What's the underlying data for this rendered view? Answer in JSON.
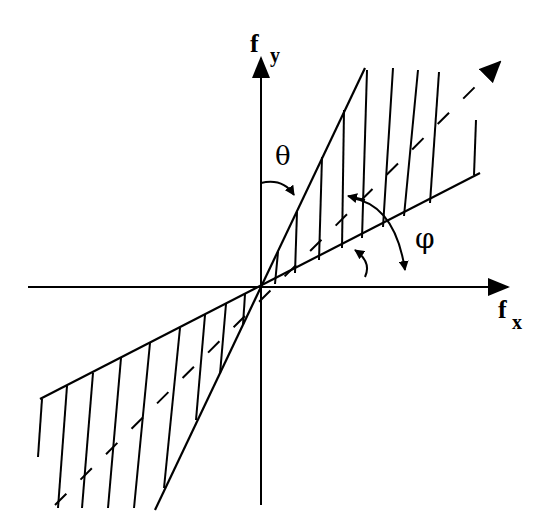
{
  "diagram": {
    "colors": {
      "ink": "#000000",
      "background": "#ffffff"
    },
    "origin": {
      "x": 261,
      "y": 287
    },
    "axes": {
      "x": {
        "label_main": "f",
        "label_sub": "x",
        "from": [
          28,
          287
        ],
        "to": [
          508,
          287
        ]
      },
      "y": {
        "label_main": "f",
        "label_sub": "y",
        "from": [
          261,
          505
        ],
        "to": [
          261,
          58
        ]
      }
    },
    "boundary_lines": {
      "steep": {
        "from": [
          155,
          510
        ],
        "to": [
          365,
          68
        ]
      },
      "shallow": {
        "from": [
          40,
          399
        ],
        "to": [
          480,
          173
        ]
      }
    },
    "center_line": {
      "from": [
        55,
        505
      ],
      "to": [
        500,
        62
      ],
      "dashed": true,
      "arrow_at_end": true
    },
    "angles": {
      "theta": {
        "symbol": "θ",
        "description": "angle between fy axis and steep boundary"
      },
      "phi": {
        "symbol": "φ",
        "description": "angle between fx axis and center line"
      }
    }
  }
}
